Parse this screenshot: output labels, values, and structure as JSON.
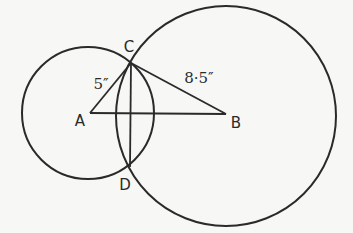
{
  "diagram": {
    "type": "geometric-construction",
    "stroke_color": "#2a2a2a",
    "background": "#f7f7f5",
    "points": {
      "A": {
        "label": "A",
        "x": 90,
        "y": 113
      },
      "B": {
        "label": "B",
        "x": 226,
        "y": 114
      },
      "C": {
        "label": "C",
        "x": 131,
        "y": 63
      },
      "D": {
        "label": "D",
        "x": 130,
        "y": 167
      }
    },
    "circles": [
      {
        "name": "circle-centered-A",
        "cx": 88,
        "cy": 113,
        "r": 66
      },
      {
        "name": "circle-centered-B",
        "cx": 226,
        "cy": 116,
        "r": 110
      }
    ],
    "segments": [
      {
        "name": "AB",
        "from": "A",
        "to": "B"
      },
      {
        "name": "AC",
        "from": "A",
        "to": "C"
      },
      {
        "name": "BC",
        "from": "B",
        "to": "C"
      },
      {
        "name": "CD",
        "from": "C",
        "to": "D"
      }
    ],
    "measurements": {
      "AC": "5″",
      "BC": "8·5″"
    }
  }
}
